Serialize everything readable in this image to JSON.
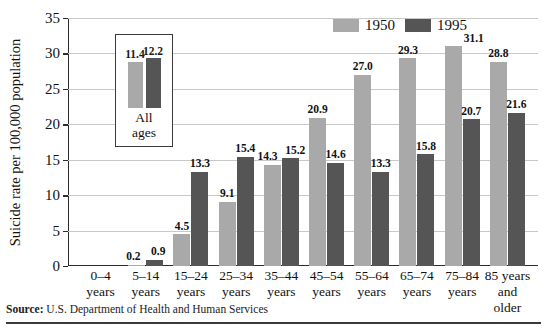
{
  "chart_data": {
    "type": "bar",
    "title": "",
    "xlabel": "",
    "ylabel": "Suicide rate per 100,000 population",
    "ylim": [
      0,
      35
    ],
    "ytick_step": 5,
    "yticks": [
      "0",
      "5",
      "10",
      "15",
      "20",
      "25",
      "30",
      "35"
    ],
    "grid": true,
    "legend_position": "top-right",
    "categories": [
      "0–4 years",
      "5–14 years",
      "15–24 years",
      "25–34 years",
      "35–44 years",
      "45–54 years",
      "55–64 years",
      "65–74 years",
      "75–84 years",
      "85 years and older"
    ],
    "category_lines": [
      [
        "0–4",
        "years"
      ],
      [
        "5–14",
        "years"
      ],
      [
        "15–24",
        "years"
      ],
      [
        "25–34",
        "years"
      ],
      [
        "35–44",
        "years"
      ],
      [
        "45–54",
        "years"
      ],
      [
        "55–64",
        "years"
      ],
      [
        "65–74",
        "years"
      ],
      [
        "75–84",
        "years"
      ],
      [
        "85 years",
        "and",
        "older"
      ]
    ],
    "series": [
      {
        "name": "1950",
        "color": "#a9a9a9",
        "values": [
          0,
          0.2,
          4.5,
          9.1,
          14.3,
          20.9,
          27.0,
          29.3,
          31.1,
          28.8
        ],
        "labels": [
          "",
          "0.2",
          "4.5",
          "9.1",
          "14.3",
          "20.9",
          "27.0",
          "29.3",
          "31.1",
          "28.8"
        ]
      },
      {
        "name": "1995",
        "color": "#555555",
        "values": [
          0,
          0.9,
          13.3,
          15.4,
          15.2,
          14.6,
          13.3,
          15.8,
          20.7,
          21.6
        ],
        "labels": [
          "",
          "0.9",
          "13.3",
          "15.4",
          "15.2",
          "14.6",
          "13.3",
          "15.8",
          "20.7",
          "21.6"
        ]
      }
    ],
    "inset": {
      "caption_lines": [
        "All",
        "ages"
      ],
      "categories": [
        "All ages"
      ],
      "series": [
        {
          "name": "1950",
          "color": "#a9a9a9",
          "values": [
            11.4
          ],
          "labels": [
            "11.4"
          ]
        },
        {
          "name": "1995",
          "color": "#555555",
          "values": [
            12.2
          ],
          "labels": [
            "12.2"
          ]
        }
      ]
    }
  },
  "legend": {
    "items": [
      {
        "label": "1950",
        "color": "#a9a9a9"
      },
      {
        "label": "1995",
        "color": "#555555"
      }
    ]
  },
  "source": {
    "label": "Source:",
    "text": "U.S. Department of Health and Human Services"
  },
  "colors": {
    "series_1950": "#a9a9a9",
    "series_1995": "#555555",
    "axis": "#2b2b2b",
    "grid": "#c9c9c9",
    "text": "#111111",
    "background": "#ffffff"
  }
}
